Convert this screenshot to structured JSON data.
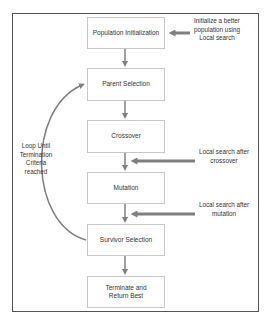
{
  "diagram": {
    "type": "flowchart",
    "steps": [
      {
        "id": "pop_init",
        "label": "Population Initialization"
      },
      {
        "id": "parent_sel",
        "label": "Parent Selection"
      },
      {
        "id": "crossover",
        "label": "Crossover"
      },
      {
        "id": "mutation",
        "label": "Mutation"
      },
      {
        "id": "survivor_sel",
        "label": "Survivor Selection"
      },
      {
        "id": "terminate",
        "label": "Terminate and Return Best"
      }
    ],
    "annotations": {
      "init_local_search": "Initialize a better population using Local search",
      "crossover_local_search": "Local search after crossover",
      "mutation_local_search": "Local search after mutation",
      "loop": "Loop Until Termination Criteria reached"
    },
    "colors": {
      "box_border": "#c8c8c8",
      "frame_border": "#555555",
      "arrow": "#7f7f7f",
      "text": "#333333"
    }
  }
}
